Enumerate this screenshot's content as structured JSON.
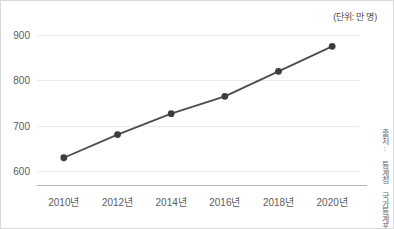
{
  "unit_note": "(단위: 만 명)",
  "source_note": "출처: 통계청 국가통계포털",
  "colors": {
    "line": "#4d4d4d",
    "marker": "#3d3d3d",
    "grid": "#e9e9e9",
    "axis": "#b5b5b5",
    "text": "#5b5b5b",
    "background": "#ffffff"
  },
  "chart_data": {
    "type": "line",
    "title": "",
    "subtitle": "",
    "xlabel": "",
    "ylabel": "",
    "unit": "만 명",
    "categories": [
      "2010년",
      "2012년",
      "2014년",
      "2016년",
      "2018년",
      "2020년"
    ],
    "x_tick_labels": [
      "2010년",
      "2012년",
      "2014년",
      "2016년",
      "2018년",
      "2020년"
    ],
    "y_tick_labels": [
      "600",
      "700",
      "800",
      "900"
    ],
    "y_ticks": [
      600,
      700,
      800,
      900
    ],
    "ylim": [
      570,
      900
    ],
    "grid": true,
    "legend": false,
    "legend_position": "none",
    "series": [
      {
        "name": "인구",
        "values": [
          630,
          681,
          727,
          765,
          820,
          875
        ]
      }
    ],
    "annotations": [
      "(단위: 만 명)",
      "출처: 통계청 국가통계포털"
    ]
  }
}
